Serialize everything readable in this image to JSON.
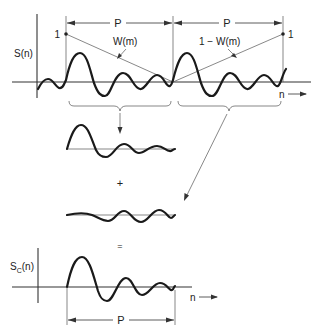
{
  "figure": {
    "type": "signal-processing-diagram",
    "top_panel": {
      "ylabel": "S(n)",
      "xlabel": "n",
      "period_label_left": "P",
      "period_label_right": "P",
      "window_label": "W(m)",
      "complement_window_label": "1 − W(m)",
      "left_point_label": "1",
      "right_point_label": "1"
    },
    "operators": {
      "plus": "+",
      "equals": "="
    },
    "bottom_panel": {
      "ylabel_main": "S",
      "ylabel_sub": "C",
      "ylabel_suffix": "(n)",
      "xlabel": "n",
      "period_label": "P"
    }
  }
}
